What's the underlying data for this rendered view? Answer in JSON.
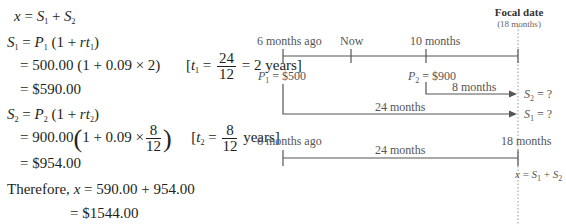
{
  "solution": {
    "line1": {
      "lhs": "x",
      "eq": " = ",
      "t1": "S",
      "s1": "1",
      "plus": " + ",
      "t2": "S",
      "s2": "2"
    },
    "line2": {
      "lhs": "S",
      "lhs_sub": "1",
      "eq": " = ",
      "p": "P",
      "p_sub": "1",
      "rest": " (1 + ",
      "rt": "rt",
      "rt_sub": "1",
      "close": ")"
    },
    "line3": {
      "text": "= 500.00 (1 + 0.09 × 2)",
      "bracket_open": "[",
      "t": "t",
      "t_sub": "1",
      "eq": " = ",
      "num": "24",
      "den": "12",
      "result": " = 2 years]"
    },
    "line4": {
      "text": "= $590.00"
    },
    "line5": {
      "lhs": "S",
      "lhs_sub": "2",
      "eq": " = ",
      "p": "P",
      "p_sub": "2",
      "rest": " (1 + ",
      "rt": "rt",
      "rt_sub": "2",
      "close": ")"
    },
    "line6": {
      "prefix": "= 900.00",
      "lparen": "(",
      "inner": "1 + 0.09 ×",
      "num": "8",
      "den": "12",
      "rparen": ")",
      "bracket_open": "[",
      "t": "t",
      "t_sub": "2",
      "eq": " = ",
      "num2": "8",
      "den2": "12",
      "result": " years]"
    },
    "line7": {
      "text": "= $954.00"
    },
    "line8": {
      "prefix": "Therefore, ",
      "x": "x",
      "text": " = 590.00 + 954.00"
    },
    "line9": {
      "text": "= $1544.00"
    }
  },
  "diagram": {
    "focal": {
      "title": "Focal date",
      "subtitle": "(18 months)"
    },
    "timeline1": {
      "labels": [
        "6 months ago",
        "Now",
        "10 months"
      ],
      "p1": {
        "sym": "P",
        "sub": "1",
        "val": " = $500"
      },
      "p2": {
        "sym": "P",
        "sub": "2",
        "val": " = $900"
      },
      "arrow_s2_label": "8 months",
      "arrow_s1_label": "24 months",
      "s2": {
        "sym": "S",
        "sub": "2",
        "val": " = ?"
      },
      "s1": {
        "sym": "S",
        "sub": "1",
        "val": " = ?"
      }
    },
    "timeline2": {
      "left_label": "6 months ago",
      "right_label": "18 months",
      "span_label": "24 months",
      "result": {
        "x": "x",
        "eq": " = ",
        "s1": "S",
        "s1_sub": "1",
        "plus": " + ",
        "s2": "S",
        "s2_sub": "2"
      }
    }
  }
}
